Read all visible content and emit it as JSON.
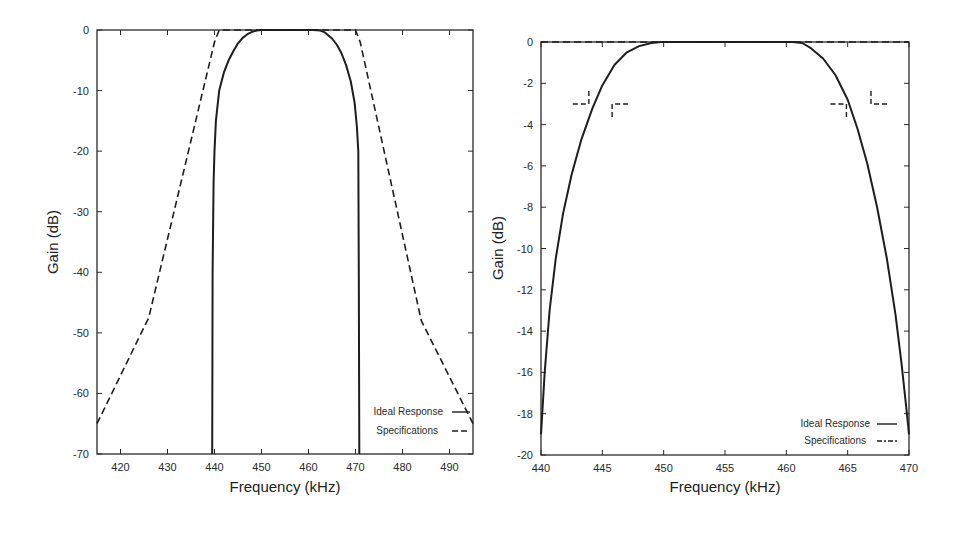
{
  "chart_data": [
    {
      "type": "line",
      "title": "",
      "xlabel": "Frequency (kHz)",
      "ylabel": "Gain (dB)",
      "xlim": [
        415,
        495
      ],
      "ylim": [
        -70,
        0
      ],
      "xticks": [
        420,
        430,
        440,
        450,
        460,
        470,
        480,
        490
      ],
      "yticks": [
        0,
        -10,
        -20,
        -30,
        -40,
        -50,
        -60,
        -70
      ],
      "grid": false,
      "legend_position": "bottom-right",
      "series": [
        {
          "name": "Ideal Response",
          "style": "solid",
          "x": [
            439.5,
            439.6,
            439.8,
            440.0,
            440.3,
            441.0,
            442.0,
            443.0,
            444.0,
            445.0,
            446.0,
            447.0,
            448.0,
            449.0,
            450.0,
            452.0,
            455.0,
            458.0,
            461.0,
            462.5,
            463.5,
            465.0,
            466.0,
            467.0,
            468.0,
            469.0,
            469.8,
            470.3,
            470.6,
            470.7,
            470.8
          ],
          "y": [
            -70,
            -40,
            -25,
            -20,
            -15,
            -10,
            -7,
            -5,
            -3.5,
            -2.2,
            -1.3,
            -0.7,
            -0.3,
            -0.1,
            0,
            0,
            0,
            0,
            0,
            -0.1,
            -0.4,
            -1.4,
            -2.4,
            -3.8,
            -5.8,
            -8.5,
            -12,
            -16,
            -20,
            -40,
            -70
          ]
        },
        {
          "name": "Specifications",
          "style": "dashed",
          "x": [
            415,
            426,
            440,
            441,
            470,
            471,
            484,
            495
          ],
          "y": [
            -65,
            -47.5,
            -2,
            0,
            0,
            -2,
            -48,
            -65
          ]
        }
      ]
    },
    {
      "type": "line",
      "title": "",
      "xlabel": "Frequency (kHz)",
      "ylabel": "Gain (dB)",
      "xlim": [
        440,
        470
      ],
      "ylim": [
        -20,
        0
      ],
      "xticks": [
        440,
        445,
        450,
        455,
        460,
        465,
        470
      ],
      "yticks": [
        0,
        -2,
        -4,
        -6,
        -8,
        -10,
        -12,
        -14,
        -16,
        -18,
        -20
      ],
      "grid": false,
      "legend_position": "bottom-right",
      "series": [
        {
          "name": "Ideal Response",
          "style": "solid",
          "x": [
            440.0,
            440.3,
            440.7,
            441.2,
            441.8,
            442.5,
            443.3,
            444.2,
            445.0,
            446.0,
            447.0,
            448.0,
            449.0,
            449.8,
            450.5,
            455.0,
            460.5,
            461.3,
            462.0,
            463.0,
            464.0,
            465.0,
            465.8,
            466.6,
            467.4,
            468.2,
            468.9,
            469.4,
            469.8,
            470.0
          ],
          "y": [
            -19,
            -16,
            -13,
            -10.5,
            -8.3,
            -6.4,
            -4.7,
            -3.2,
            -2.1,
            -1.1,
            -0.5,
            -0.2,
            -0.05,
            0,
            0,
            0,
            0,
            -0.05,
            -0.3,
            -0.8,
            -1.6,
            -2.8,
            -4.2,
            -5.9,
            -8,
            -10.5,
            -13.2,
            -15.6,
            -17.8,
            -19
          ]
        },
        {
          "name": "Specifications",
          "style": "dashed",
          "x": [
            440,
            470
          ],
          "y": [
            0,
            0
          ]
        }
      ],
      "spec_markers": [
        {
          "corner": [
            443.9,
            -3
          ],
          "arms": "left-up"
        },
        {
          "corner": [
            445.8,
            -3
          ],
          "arms": "right-down"
        },
        {
          "corner": [
            464.9,
            -3
          ],
          "arms": "left-down"
        },
        {
          "corner": [
            466.9,
            -3
          ],
          "arms": "right-up"
        }
      ]
    }
  ],
  "legend": {
    "ideal_label": "Ideal Response",
    "spec_label": "Specifications"
  },
  "labels": {
    "xlabel": "Frequency (kHz)",
    "ylabel": "Gain (dB)"
  }
}
